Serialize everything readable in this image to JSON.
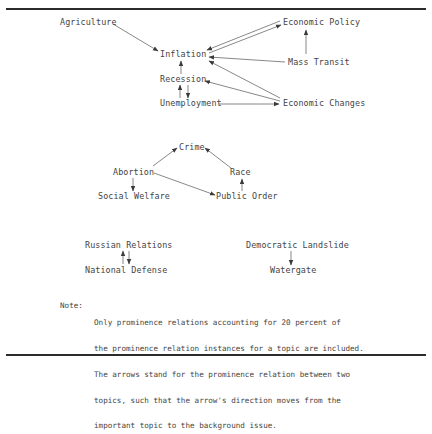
{
  "diagram": {
    "clusters": [
      {
        "name": "economy",
        "nodes": {
          "agriculture": "Agriculture",
          "economic_policy": "Economic Policy",
          "inflation": "Inflation",
          "mass_transit": "Mass Transit",
          "recession": "Recession",
          "unemployment": "Unemployment",
          "economic_changes": "Economic Changes"
        }
      },
      {
        "name": "social",
        "nodes": {
          "crime": "Crime",
          "abortion": "Abortion",
          "race": "Race",
          "social_welfare": "Social Welfare",
          "public_order": "Public Order"
        }
      },
      {
        "name": "defense",
        "nodes": {
          "russian_relations": "Russian Relations",
          "national_defense": "National Defense"
        }
      },
      {
        "name": "politics",
        "nodes": {
          "democratic_landslide": "Democratic Landslide",
          "watergate": "Watergate"
        }
      }
    ],
    "edges": [
      {
        "from": "Agriculture",
        "to": "Inflation"
      },
      {
        "from": "Inflation",
        "to": "Economic Policy"
      },
      {
        "from": "Economic Policy",
        "to": "Inflation"
      },
      {
        "from": "Mass Transit",
        "to": "Economic Policy"
      },
      {
        "from": "Mass Transit",
        "to": "Inflation"
      },
      {
        "from": "Recession",
        "to": "Inflation"
      },
      {
        "from": "Economic Changes",
        "to": "Inflation"
      },
      {
        "from": "Economic Changes",
        "to": "Recession"
      },
      {
        "from": "Unemployment",
        "to": "Recession"
      },
      {
        "from": "Recession",
        "to": "Unemployment"
      },
      {
        "from": "Unemployment",
        "to": "Economic Changes"
      },
      {
        "from": "Abortion",
        "to": "Crime"
      },
      {
        "from": "Race",
        "to": "Crime"
      },
      {
        "from": "Abortion",
        "to": "Social Welfare"
      },
      {
        "from": "Abortion",
        "to": "Public Order"
      },
      {
        "from": "Public Order",
        "to": "Race"
      },
      {
        "from": "National Defense",
        "to": "Russian Relations"
      },
      {
        "from": "Russian Relations",
        "to": "National Defense"
      },
      {
        "from": "Democratic Landslide",
        "to": "Watergate"
      }
    ]
  },
  "note": {
    "label": "Note:",
    "lines": [
      "Only prominence relations accounting for 20 percent of",
      "the prominence relation instances for a topic are included.",
      "The arrows stand for the prominence relation between two",
      "topics, such that the arrow's direction moves from the",
      "important topic to the background issue."
    ]
  }
}
